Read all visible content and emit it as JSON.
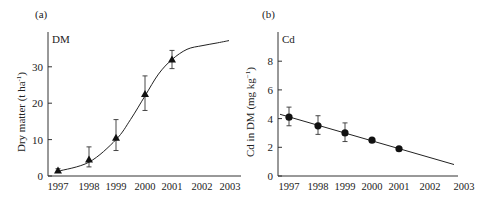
{
  "chart_data": [
    {
      "panel": "(a)",
      "type": "line",
      "inner_label": "DM",
      "title": "",
      "xlabel": "",
      "ylabel": "Dry matter (t ha⁻¹)",
      "x_ticks": [
        "1997",
        "1998",
        "1999",
        "2000",
        "2001",
        "2002",
        "2003"
      ],
      "y_ticks": [
        "0",
        "10",
        "20",
        "30"
      ],
      "ylim": [
        0,
        38
      ],
      "xlim": [
        1997,
        2003
      ],
      "grid": false,
      "marker": "triangle",
      "points": [
        {
          "x": 1997,
          "y": 1.5,
          "err_low": 1.0,
          "err_high": 2.0
        },
        {
          "x": 1998,
          "y": 4.5,
          "err_low": 2.5,
          "err_high": 8.0
        },
        {
          "x": 1999,
          "y": 10.5,
          "err_low": 7.0,
          "err_high": 15.5
        },
        {
          "x": 2000,
          "y": 22.5,
          "err_low": 18.0,
          "err_high": 27.5
        },
        {
          "x": 2001,
          "y": 32.0,
          "err_low": 29.5,
          "err_high": 34.5
        }
      ],
      "fit_curve": {
        "type": "sigmoid",
        "x": [
          1997,
          1998,
          1999,
          1999.5,
          2000,
          2000.5,
          2001,
          2001.5,
          2002,
          2002.5,
          2003
        ],
        "y": [
          1.3,
          3.8,
          10.0,
          15.5,
          22.0,
          28.0,
          32.0,
          34.8,
          35.8,
          36.5,
          37.2
        ]
      }
    },
    {
      "panel": "(b)",
      "type": "line",
      "inner_label": "Cd",
      "title": "",
      "xlabel": "",
      "ylabel": "Cd in DM (mg kg⁻¹)",
      "x_ticks": [
        "1997",
        "1998",
        "1999",
        "2000",
        "2001",
        "2002",
        "2003"
      ],
      "y_ticks": [
        "0",
        "2",
        "4",
        "6",
        "8"
      ],
      "ylim": [
        0,
        9.8
      ],
      "xlim": [
        1997,
        2003
      ],
      "grid": false,
      "marker": "circle",
      "points": [
        {
          "x": 1997,
          "y": 4.1,
          "err_low": 3.5,
          "err_high": 4.8
        },
        {
          "x": 1998,
          "y": 3.5,
          "err_low": 2.9,
          "err_high": 4.2
        },
        {
          "x": 1999,
          "y": 3.0,
          "err_low": 2.4,
          "err_high": 3.7
        },
        {
          "x": 2000,
          "y": 2.5,
          "err_low": 2.5,
          "err_high": 2.5
        },
        {
          "x": 2001,
          "y": 1.9,
          "err_low": 1.9,
          "err_high": 1.9
        }
      ],
      "fit_line": {
        "x": [
          1996.7,
          2002.8
        ],
        "y": [
          4.3,
          0.8
        ]
      }
    }
  ]
}
